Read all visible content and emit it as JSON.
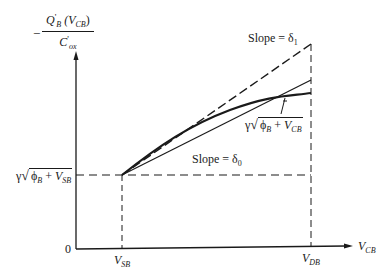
{
  "figure": {
    "type": "diagram",
    "y_axis_label": {
      "prefix": "−",
      "numerator_main": "Q",
      "numerator_prime": "'",
      "numerator_sub": "B",
      "numerator_arg_open": " (V",
      "numerator_arg_sub": "CB",
      "numerator_arg_close": ")",
      "denominator_main": "C",
      "denominator_prime": "'",
      "denominator_sub": "ox"
    },
    "x_axis_label": {
      "main": "V",
      "sub": "CB"
    },
    "origin_label": "0",
    "x_ticks": [
      {
        "main": "V",
        "sub": "SB"
      },
      {
        "main": "V",
        "sub": "DB"
      }
    ],
    "y_tick": {
      "gamma": "γ",
      "phi": "ϕ",
      "phi_sub": "B",
      "plus": " + ",
      "v": "V",
      "v_sub": "SB"
    },
    "annotations": {
      "slope1": {
        "text": "Slope = δ",
        "sub": "1"
      },
      "slope0": {
        "text": "Slope = δ",
        "sub": "0"
      },
      "curve": {
        "gamma": "γ",
        "phi": "ϕ",
        "phi_sub": "B",
        "plus": " + ",
        "v": "V",
        "v_sub": "CB"
      }
    },
    "colors": {
      "ink": "#1a1a1a",
      "background": "#ffffff"
    }
  }
}
